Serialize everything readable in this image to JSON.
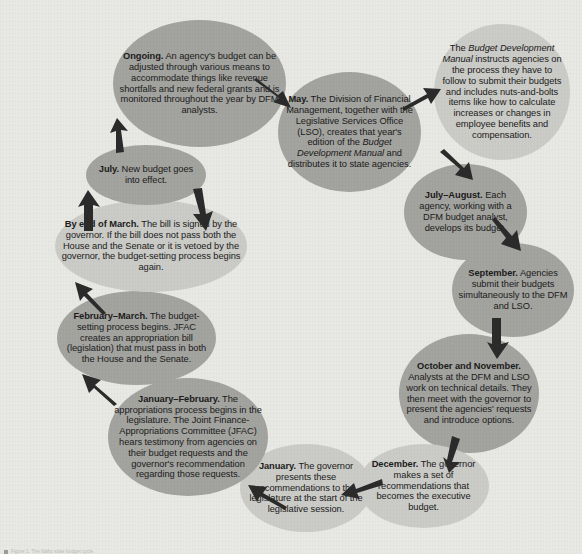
{
  "diagram": {
    "title": "Idaho State Budget Cycle",
    "type": "cycle-flowchart",
    "background_color": "#e8e8e4",
    "node_color_dark": "#a3a39f",
    "node_color_light": "#cbcbc7",
    "arrow_color": "#2b2b2b",
    "direction": "clockwise"
  },
  "nodes": [
    {
      "id": "ongoing",
      "shade": "dark",
      "heading": "Ongoing.",
      "body": "An agency's budget can be adjusted through various means to accommodate things like revenue shortfalls and new federal grants and is monitored throughout the year by DFM analysts."
    },
    {
      "id": "may",
      "shade": "dark",
      "heading": "May.",
      "body_pre": "The Division of Financial Management, together with the Legislative Services Office (LSO), creates that year's edition of the ",
      "body_italic": "Budget Development Manual",
      "body_post": " and distributes it to state agencies."
    },
    {
      "id": "manual",
      "shade": "light",
      "heading": "",
      "body_pre": "The ",
      "body_italic": "Budget Development Manual",
      "body_post": " instructs agencies on the process they have to follow to submit their budgets and includes nuts-and-bolts items like how to calculate increases or changes in employee benefits and compensation."
    },
    {
      "id": "july-august",
      "shade": "dark",
      "heading": "July–August.",
      "body": "Each agency, working with a DFM budget analyst, develops its budget."
    },
    {
      "id": "september",
      "shade": "dark",
      "heading": "September.",
      "body": "Agencies submit their budgets simultaneously to the DFM and LSO."
    },
    {
      "id": "october-november",
      "shade": "dark",
      "heading": "October and November.",
      "body": "Analysts at the DFM and LSO work on technical details. They then meet with the governor to present the agencies' requests and introduce options."
    },
    {
      "id": "december",
      "shade": "light",
      "heading": "December.",
      "body": "The governor makes a set of recommendations that becomes the executive budget."
    },
    {
      "id": "january",
      "shade": "light",
      "heading": "January.",
      "body": "The governor presents these recommendations to the legislature at the start of the legislative session."
    },
    {
      "id": "january-february",
      "shade": "dark",
      "heading": "January–February.",
      "body": "The appropriations process begins in the legislature. The Joint Finance-Appropriations Committee (JFAC) hears testimony from agencies on their budget requests and the governor's recommendation regarding those requests."
    },
    {
      "id": "february-march",
      "shade": "dark",
      "heading": "February–March.",
      "body": "The budget-setting process begins. JFAC creates an appropriation bill (legislation) that must pass in both the House and the Senate."
    },
    {
      "id": "by-end-of-march",
      "shade": "light",
      "heading": "By end of March.",
      "body": "The bill is signed by the governor. If the bill does not pass both the House and the Senate or it is vetoed by the governor, the budget-setting process begins again."
    },
    {
      "id": "july",
      "shade": "dark",
      "heading": "July.",
      "body": "New budget goes into effect."
    }
  ],
  "arrows": [
    {
      "id": "ongoing-to-may",
      "from": "ongoing",
      "to": "may"
    },
    {
      "id": "may-to-manual",
      "from": "may",
      "to": "manual"
    },
    {
      "id": "manual-to-july-august",
      "from": "manual",
      "to": "july-august"
    },
    {
      "id": "july-august-to-september",
      "from": "july-august",
      "to": "september"
    },
    {
      "id": "september-to-october-november",
      "from": "september",
      "to": "october-november"
    },
    {
      "id": "october-november-to-december",
      "from": "october-november",
      "to": "december"
    },
    {
      "id": "december-to-january",
      "from": "december",
      "to": "january"
    },
    {
      "id": "january-to-january-february",
      "from": "january",
      "to": "january-february"
    },
    {
      "id": "january-february-to-february-march",
      "from": "january-february",
      "to": "february-march"
    },
    {
      "id": "february-march-to-by-end-of-march",
      "from": "february-march",
      "to": "by-end-of-march"
    },
    {
      "id": "by-end-of-march-to-july",
      "from": "by-end-of-march",
      "to": "july"
    },
    {
      "id": "july-to-ongoing",
      "from": "july",
      "to": "ongoing"
    },
    {
      "id": "by-end-of-march-loopback",
      "from": "by-end-of-march",
      "to": "february-march"
    }
  ],
  "credit": {
    "text": "Figure 1. The Idaho state budget cycle."
  }
}
